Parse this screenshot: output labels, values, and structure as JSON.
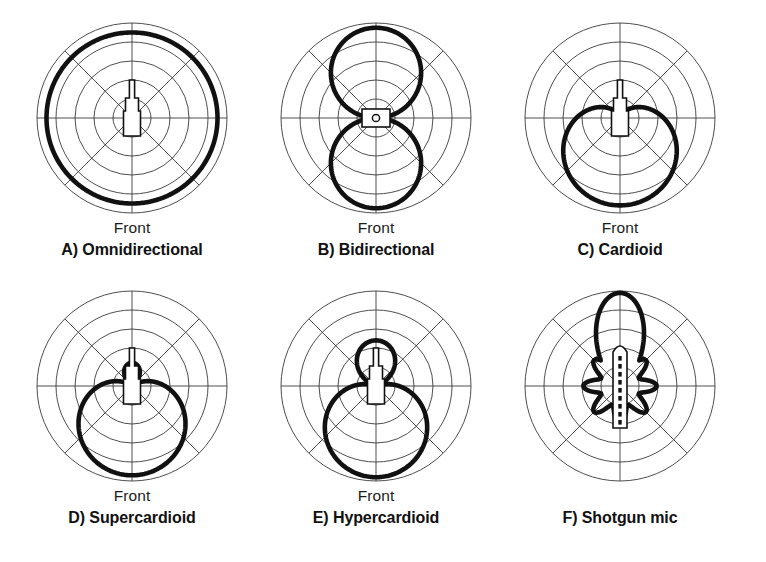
{
  "figure": {
    "background_color": "#ffffff",
    "curve_color": "#111111",
    "grid_color": "#3a3a3a",
    "columns": 3,
    "rows": 2
  },
  "labels": {
    "front": "Front"
  },
  "grid": {
    "rings": 5,
    "spokes": 8,
    "spoke_angles_deg": [
      0,
      45,
      90,
      135,
      180,
      225,
      270,
      315
    ],
    "outer_radius_px": 95,
    "ring_radii_fraction": [
      0.2,
      0.4,
      0.6,
      0.8,
      1.0
    ]
  },
  "chart_data": {
    "type": "line",
    "subtype": "polar",
    "rlim": [
      0,
      1
    ],
    "rticks": [
      0.2,
      0.4,
      0.6,
      0.8,
      1.0
    ],
    "theta_zero_location": "bottom",
    "grid": true,
    "legend": false,
    "panels": [
      {
        "id": "A",
        "key": "omnidirectional",
        "caption": "A) Omnidirectional",
        "front_label": "Front",
        "show_front": true,
        "mic_icon": "mic-capsule-up",
        "equation": "r = 1",
        "coefficients": {
          "a": 1.0,
          "b": 0.0
        },
        "radius_at_angles": {
          "0": 0.9,
          "45": 0.9,
          "90": 0.9,
          "135": 0.9,
          "180": 0.9,
          "225": 0.9,
          "270": 0.9,
          "315": 0.9
        }
      },
      {
        "id": "B",
        "key": "bidirectional",
        "caption": "B) Bidirectional",
        "front_label": "Front",
        "show_front": true,
        "mic_icon": "mic-capsule-side",
        "equation": "r = |cos(theta)|",
        "coefficients": {
          "a": 0.0,
          "b": 1.0
        },
        "radius_at_angles": {
          "0": 0.95,
          "45": 0.67,
          "90": 0.0,
          "135": 0.67,
          "180": 0.95,
          "225": 0.67,
          "270": 0.0,
          "315": 0.67
        }
      },
      {
        "id": "C",
        "key": "cardioid",
        "caption": "C) Cardioid",
        "front_label": "Front",
        "show_front": true,
        "mic_icon": "mic-capsule-up",
        "equation": "r = 0.5 + 0.5*cos(theta)",
        "coefficients": {
          "a": 0.5,
          "b": 0.5
        },
        "radius_at_angles": {
          "0": 0.92,
          "45": 0.79,
          "90": 0.46,
          "135": 0.14,
          "180": 0.02,
          "225": 0.14,
          "270": 0.46,
          "315": 0.79
        }
      },
      {
        "id": "D",
        "key": "supercardioid",
        "caption": "D) Supercardioid",
        "front_label": "Front",
        "show_front": true,
        "mic_icon": "mic-capsule-up",
        "equation": "r = |0.37 + 0.63*cos(theta)|",
        "coefficients": {
          "a": 0.37,
          "b": 0.63
        },
        "radius_at_angles": {
          "0": 0.94,
          "45": 0.77,
          "90": 0.35,
          "135": 0.07,
          "180": 0.25,
          "225": 0.07,
          "270": 0.35,
          "315": 0.77
        }
      },
      {
        "id": "E",
        "key": "hypercardioid",
        "caption": "E) Hypercardioid",
        "front_label": "Front",
        "show_front": true,
        "mic_icon": "mic-capsule-up",
        "equation": "r = |0.25 + 0.75*cos(theta)|",
        "coefficients": {
          "a": 0.25,
          "b": 0.75
        },
        "radius_at_angles": {
          "0": 0.96,
          "45": 0.77,
          "90": 0.25,
          "135": 0.28,
          "180": 0.52,
          "225": 0.28,
          "270": 0.25,
          "315": 0.77
        }
      },
      {
        "id": "F",
        "key": "shotgun",
        "caption": "F) Shotgun mic",
        "front_label": "",
        "show_front": false,
        "mic_icon": "shotgun-tube",
        "equation": "lobed interference-tube pattern",
        "main_lobe_direction": "up",
        "side_lobe_count": 8,
        "radius_at_angles": {
          "0": 0.3,
          "45": 0.4,
          "90": 0.45,
          "135": 0.48,
          "180": 1.0,
          "225": 0.48,
          "270": 0.45,
          "315": 0.4
        }
      }
    ]
  }
}
